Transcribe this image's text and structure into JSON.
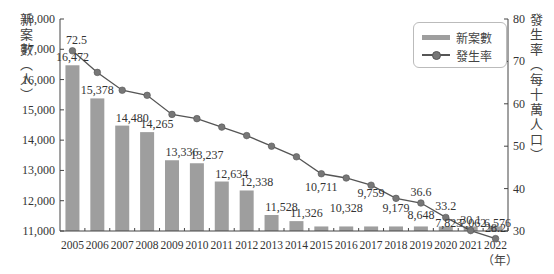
{
  "chart_data": {
    "type": "bar+line",
    "title": "",
    "categories": [
      "2005",
      "2006",
      "2007",
      "2008",
      "2009",
      "2010",
      "2011",
      "2012",
      "2013",
      "2014",
      "2015",
      "2016",
      "2017",
      "2018",
      "2019",
      "2020",
      "2021",
      "2022"
    ],
    "series": [
      {
        "name": "新案數",
        "type": "bar",
        "axis": "left",
        "values": [
          16472,
          15378,
          14480,
          14265,
          13336,
          13237,
          12634,
          12338,
          11528,
          11326,
          10711,
          10328,
          9759,
          9179,
          8648,
          7823,
          7062,
          6576
        ],
        "labels": [
          "16,472",
          "15,378",
          "14,480",
          "14,265",
          "13,336",
          "13,237",
          "12,634",
          "12,338",
          "11,528",
          "11,326",
          "10,711",
          "10,328",
          "9,759",
          "9,179",
          "8,648",
          "7,823",
          "7,062",
          "6,576"
        ]
      },
      {
        "name": "發生率",
        "type": "line",
        "axis": "right",
        "values": [
          72.5,
          67.4,
          63.2,
          62.0,
          57.5,
          56.5,
          54.5,
          52.5,
          50.0,
          47.5,
          43.5,
          42.5,
          40.8,
          37.7,
          36.6,
          33.2,
          30.1,
          28.2
        ],
        "labels": [
          "72.5",
          "",
          "",
          "",
          "",
          "",
          "",
          "",
          "",
          "",
          "",
          "",
          "",
          "",
          "36.6",
          "33.2",
          "30.1",
          "28.2"
        ]
      }
    ],
    "xlabel": "（年）",
    "ylabel": "新案數（人）",
    "y2label": "發生率（每十萬人口）",
    "ylim": [
      11000,
      18000
    ],
    "y2lim": [
      30,
      80
    ],
    "yticks": [
      "11,000",
      "12,000",
      "13,000",
      "14,000",
      "15,000",
      "16,000",
      "17,000",
      "18,000"
    ],
    "y2ticks": [
      "30",
      "40",
      "50",
      "60",
      "70",
      "80"
    ],
    "legend_position": "top-right",
    "grid": false,
    "colors": {
      "bar": "#9e9e9e",
      "line": "#555555",
      "marker": "#777777"
    }
  },
  "axis_titles": {
    "left": [
      "新",
      "案",
      "數",
      "︵",
      "人",
      "︶"
    ],
    "right": [
      "發",
      "生",
      "率",
      "︵",
      "每",
      "十",
      "萬",
      "人",
      "口",
      "︶"
    ],
    "x_unit": "（年）"
  },
  "legend": {
    "bar_label": "新案數",
    "line_label": "發生率"
  }
}
